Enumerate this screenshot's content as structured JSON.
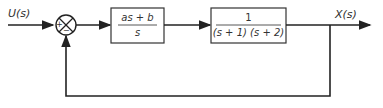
{
  "diagram": {
    "input_label": "U(s)",
    "output_label": "X(s)",
    "summing_junction": {
      "signs": [
        "+",
        "−"
      ]
    },
    "blocks": [
      {
        "name": "controller",
        "numerator": "as + b",
        "denominator": "s"
      },
      {
        "name": "plant",
        "numerator": "1",
        "denominator": "(s + 1) (s + 2)"
      }
    ],
    "feedback": "unity negative feedback"
  }
}
